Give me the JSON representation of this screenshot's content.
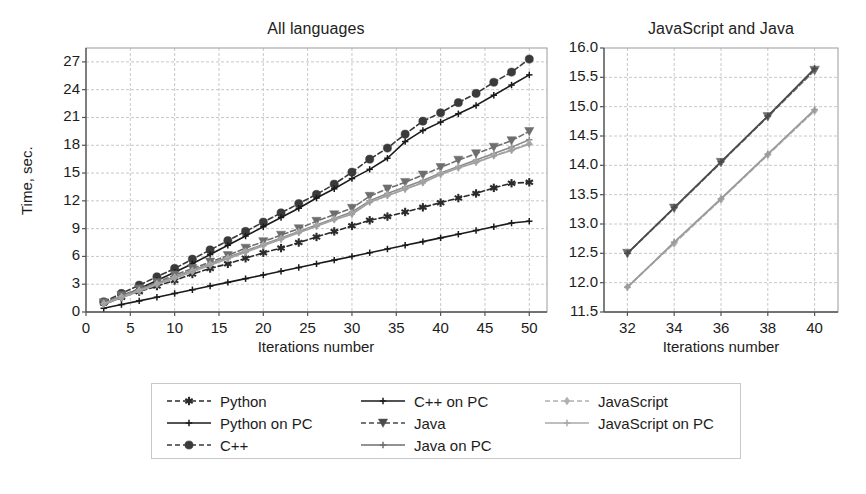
{
  "figure": {
    "background": "#ffffff",
    "text_color": "#1c1c1c",
    "grid_color": "#c8c8c8",
    "frame_color": "#9a9a9a"
  },
  "chart_data": [
    {
      "type": "line",
      "id": "all-languages",
      "title": "All languages",
      "xlabel": "Iterations number",
      "ylabel": "Time, sec.",
      "xlim": [
        0,
        52
      ],
      "ylim": [
        0,
        28.5
      ],
      "xticks": [
        0,
        5,
        10,
        15,
        20,
        25,
        30,
        35,
        40,
        45,
        50
      ],
      "yticks": [
        0,
        3,
        6,
        9,
        12,
        15,
        18,
        21,
        24,
        27
      ],
      "grid": true,
      "legend_position": "below",
      "x": [
        2,
        4,
        6,
        8,
        10,
        12,
        14,
        16,
        18,
        20,
        22,
        24,
        26,
        28,
        30,
        32,
        34,
        36,
        38,
        40,
        42,
        44,
        46,
        48,
        50
      ],
      "series": [
        {
          "name": "Python",
          "color": "#2b2b2b",
          "marker": "star",
          "dash": "dashed",
          "values": [
            1.0,
            1.6,
            2.2,
            2.8,
            3.4,
            4.1,
            4.7,
            5.2,
            5.8,
            6.4,
            6.9,
            7.5,
            8.1,
            8.7,
            9.3,
            9.9,
            10.3,
            10.8,
            11.3,
            11.8,
            12.3,
            12.8,
            13.4,
            13.9,
            14.0
          ]
        },
        {
          "name": "Python on PC",
          "color": "#1a1a1a",
          "marker": "plus",
          "dash": "solid",
          "values": [
            0.4,
            0.8,
            1.2,
            1.6,
            2.0,
            2.4,
            2.8,
            3.2,
            3.6,
            4.0,
            4.4,
            4.8,
            5.2,
            5.6,
            6.0,
            6.4,
            6.8,
            7.2,
            7.6,
            8.0,
            8.4,
            8.8,
            9.2,
            9.6,
            9.8
          ]
        },
        {
          "name": "C++",
          "color": "#3a3a3a",
          "marker": "circle",
          "dash": "dashed",
          "values": [
            1.1,
            2.0,
            2.9,
            3.8,
            4.7,
            5.7,
            6.7,
            7.7,
            8.7,
            9.7,
            10.7,
            11.7,
            12.7,
            13.8,
            15.1,
            16.5,
            17.7,
            19.2,
            20.6,
            21.5,
            22.6,
            23.6,
            24.8,
            25.9,
            27.3
          ]
        },
        {
          "name": "C++ on PC",
          "color": "#1a1a1a",
          "marker": "plus",
          "dash": "solid",
          "values": [
            0.8,
            1.6,
            2.5,
            3.4,
            4.3,
            5.2,
            6.2,
            7.2,
            8.2,
            9.2,
            10.2,
            11.2,
            12.3,
            13.3,
            14.4,
            15.4,
            16.6,
            18.4,
            19.6,
            20.5,
            21.4,
            22.3,
            23.4,
            24.5,
            25.6
          ]
        },
        {
          "name": "Java",
          "color": "#6e6e6e",
          "marker": "triangle-down",
          "dash": "dashed",
          "values": [
            1.0,
            1.8,
            2.5,
            3.2,
            4.0,
            4.7,
            5.4,
            6.1,
            6.9,
            7.6,
            8.3,
            9.0,
            9.8,
            10.5,
            11.2,
            12.5,
            13.3,
            14.0,
            14.8,
            15.6,
            16.4,
            17.1,
            17.8,
            18.5,
            19.5
          ]
        },
        {
          "name": "Java on PC",
          "color": "#8a8a8a",
          "marker": "plus",
          "dash": "solid",
          "values": [
            0.9,
            1.7,
            2.4,
            3.1,
            3.8,
            4.5,
            5.2,
            5.9,
            6.6,
            7.3,
            8.0,
            8.7,
            9.4,
            10.1,
            10.8,
            12.0,
            12.8,
            13.5,
            14.2,
            15.0,
            15.7,
            16.4,
            17.1,
            17.8,
            18.6
          ]
        },
        {
          "name": "JavaScript",
          "color": "#b0b0b0",
          "marker": "diamond",
          "dash": "dashed",
          "values": [
            0.9,
            1.6,
            2.3,
            3.0,
            3.7,
            4.4,
            5.1,
            5.8,
            6.5,
            7.2,
            7.9,
            8.6,
            9.3,
            10.0,
            10.6,
            11.9,
            12.6,
            13.3,
            14.0,
            14.9,
            15.6,
            16.2,
            16.9,
            17.5,
            18.2
          ]
        },
        {
          "name": "JavaScript on PC",
          "color": "#a0a0a0",
          "marker": "plus",
          "dash": "solid",
          "values": [
            0.85,
            1.55,
            2.25,
            2.95,
            3.65,
            4.35,
            5.05,
            5.75,
            6.45,
            7.15,
            7.85,
            8.55,
            9.25,
            9.95,
            10.55,
            11.85,
            12.55,
            13.25,
            13.95,
            14.85,
            15.55,
            16.15,
            16.85,
            17.45,
            18.1
          ]
        }
      ]
    },
    {
      "type": "line",
      "id": "javascript-and-java",
      "title": "JavaScript and Java",
      "xlabel": "Iterations number",
      "ylabel": "",
      "xlim": [
        31,
        41
      ],
      "ylim": [
        11.5,
        16.0
      ],
      "xticks": [
        32,
        34,
        36,
        38,
        40
      ],
      "yticks": [
        11.5,
        12.0,
        12.5,
        13.0,
        13.5,
        14.0,
        14.5,
        15.0,
        15.5,
        16.0
      ],
      "grid": true,
      "x": [
        32,
        34,
        36,
        38,
        40
      ],
      "series": [
        {
          "name": "Java",
          "color": "#6e6e6e",
          "marker": "triangle-down",
          "dash": "dashed",
          "values": [
            12.5,
            13.27,
            14.05,
            14.83,
            15.62
          ]
        },
        {
          "name": "Java on PC",
          "color": "#4a4a4a",
          "marker": "plus",
          "dash": "solid",
          "values": [
            12.5,
            13.28,
            14.06,
            14.84,
            15.65
          ]
        },
        {
          "name": "JavaScript",
          "color": "#b0b0b0",
          "marker": "diamond",
          "dash": "dashed",
          "values": [
            11.93,
            12.67,
            13.42,
            14.18,
            14.93
          ]
        },
        {
          "name": "JavaScript on PC",
          "color": "#9b9b9b",
          "marker": "plus",
          "dash": "solid",
          "values": [
            11.92,
            12.69,
            13.43,
            14.19,
            14.95
          ]
        }
      ]
    }
  ],
  "legend": {
    "columns": 3,
    "rows": 3,
    "entries": [
      {
        "label": "Python",
        "color": "#2b2b2b",
        "marker": "star",
        "dash": "dashed",
        "col": 0,
        "row": 0
      },
      {
        "label": "Python on PC",
        "color": "#1a1a1a",
        "marker": "plus",
        "dash": "solid",
        "col": 0,
        "row": 1
      },
      {
        "label": "C++",
        "color": "#3a3a3a",
        "marker": "circle",
        "dash": "dashed",
        "col": 0,
        "row": 2
      },
      {
        "label": "C++ on PC",
        "color": "#1a1a1a",
        "marker": "plus",
        "dash": "solid",
        "col": 1,
        "row": 0
      },
      {
        "label": "Java",
        "color": "#4a4a4a",
        "marker": "triangle-down",
        "dash": "dashed",
        "col": 1,
        "row": 1
      },
      {
        "label": "Java on PC",
        "color": "#6e6e6e",
        "marker": "plus",
        "dash": "solid",
        "col": 1,
        "row": 2
      },
      {
        "label": "JavaScript",
        "color": "#b0b0b0",
        "marker": "diamond",
        "dash": "dashed",
        "col": 2,
        "row": 0
      },
      {
        "label": "JavaScript on PC",
        "color": "#a8a8a8",
        "marker": "plus",
        "dash": "solid",
        "col": 2,
        "row": 1
      }
    ]
  }
}
